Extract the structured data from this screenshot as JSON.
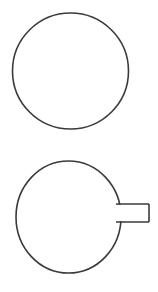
{
  "canvas": {
    "width": 158,
    "height": 292,
    "background_color": "#ffffff",
    "stroke_color": "#3a3a3a",
    "stroke_width": 1.6,
    "fill": "none"
  },
  "diagram": {
    "title": "",
    "figure_count": 2,
    "figures": [
      {
        "name": "plain-circle",
        "label": "",
        "type": "circle",
        "cx": 70.5,
        "cy": 71,
        "r": 58,
        "fill": "none",
        "stroke_color": "#3a3a3a",
        "stroke_width": 1.6
      },
      {
        "name": "circle-with-handle",
        "label": "",
        "type": "circle-with-rectangle-tab",
        "circle": {
          "cx": 68.5,
          "cy": 217,
          "rx": 52.5,
          "ry": 56,
          "fill": "none",
          "stroke_color": "#3a3a3a",
          "stroke_width": 1.6
        },
        "tab": {
          "x": 120,
          "y": 204,
          "width": 29,
          "height": 18,
          "fill": "none",
          "stroke_color": "#3a3a3a",
          "stroke_width": 1.6
        }
      }
    ]
  }
}
